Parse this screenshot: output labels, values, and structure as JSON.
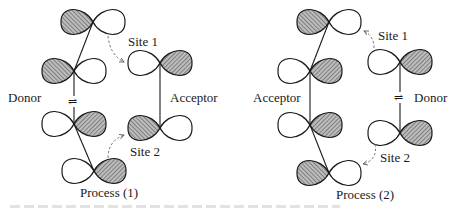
{
  "colors": {
    "stroke": "#1a1a1a",
    "hatch": "#555555",
    "hatch_bg": "#bdbdbd",
    "arrow": "#666666"
  },
  "panels": [
    {
      "id": "process-1",
      "caption": "Process (1)",
      "caption_pos": [
        92,
        186
      ],
      "labels": [
        {
          "text": "Donor",
          "x": 8,
          "y": 91,
          "role": "donor"
        },
        {
          "text": "Acceptor",
          "x": 170,
          "y": 91,
          "role": "acceptor"
        },
        {
          "text": "Site 1",
          "x": 128,
          "y": 35,
          "role": "site-1"
        },
        {
          "text": "Site 2",
          "x": 130,
          "y": 145,
          "role": "site-2"
        }
      ],
      "equilibrium_symbol": {
        "glyph": "⇌",
        "x": 74,
        "y": 97
      },
      "bonds": [
        [
          [
            93,
            22
          ],
          [
            74,
            71
          ]
        ],
        [
          [
            74,
            71
          ],
          [
            74,
            124
          ]
        ],
        [
          [
            74,
            124
          ],
          [
            94,
            171
          ]
        ],
        [
          [
            160,
            63
          ],
          [
            160,
            128
          ]
        ]
      ],
      "orbitals": [
        {
          "group": "donor",
          "cx": 93,
          "cy": 22,
          "len": 32,
          "shaded": "left"
        },
        {
          "group": "donor",
          "cx": 74,
          "cy": 71,
          "len": 32,
          "shaded": "left"
        },
        {
          "group": "donor",
          "cx": 74,
          "cy": 124,
          "len": 32,
          "shaded": "right"
        },
        {
          "group": "donor",
          "cx": 94,
          "cy": 171,
          "len": 32,
          "shaded": "right"
        },
        {
          "group": "acceptor",
          "cx": 160,
          "cy": 63,
          "len": 32,
          "shaded": "right"
        },
        {
          "group": "acceptor",
          "cx": 160,
          "cy": 128,
          "len": 32,
          "shaded": "left"
        }
      ],
      "arrows": [
        {
          "site": "site-1",
          "path": "M 108 36 Q 110 55 124 62"
        },
        {
          "site": "site-2",
          "path": "M 108 158 Q 108 141 124 135"
        }
      ]
    },
    {
      "id": "process-2",
      "caption": "Process (2)",
      "caption_pos": [
        338,
        188
      ],
      "labels": [
        {
          "text": "Acceptor",
          "x": 253,
          "y": 91,
          "role": "acceptor"
        },
        {
          "text": "Donor",
          "x": 414,
          "y": 91,
          "role": "donor"
        },
        {
          "text": "Site 1",
          "x": 378,
          "y": 29,
          "role": "site-1"
        },
        {
          "text": "Site 2",
          "x": 380,
          "y": 151,
          "role": "site-2"
        }
      ],
      "equilibrium_symbol": {
        "glyph": "⇌",
        "x": 400,
        "y": 97
      },
      "bonds": [
        [
          [
            329,
            22
          ],
          [
            310,
            71
          ]
        ],
        [
          [
            310,
            71
          ],
          [
            310,
            125
          ]
        ],
        [
          [
            310,
            125
          ],
          [
            329,
            173
          ]
        ],
        [
          [
            400,
            62
          ],
          [
            400,
            133
          ]
        ]
      ],
      "orbitals": [
        {
          "group": "acceptor",
          "cx": 329,
          "cy": 22,
          "len": 32,
          "shaded": "left"
        },
        {
          "group": "acceptor",
          "cx": 310,
          "cy": 71,
          "len": 32,
          "shaded": "right"
        },
        {
          "group": "acceptor",
          "cx": 310,
          "cy": 125,
          "len": 32,
          "shaded": "right"
        },
        {
          "group": "acceptor",
          "cx": 329,
          "cy": 173,
          "len": 32,
          "shaded": "left"
        },
        {
          "group": "donor",
          "cx": 400,
          "cy": 62,
          "len": 32,
          "shaded": "right"
        },
        {
          "group": "donor",
          "cx": 400,
          "cy": 133,
          "len": 32,
          "shaded": "right"
        }
      ],
      "arrows": [
        {
          "site": "site-1",
          "path": "M 374 48 Q 374 36 364 31"
        },
        {
          "site": "site-2",
          "path": "M 375 144 Q 378 160 363 164"
        }
      ]
    }
  ]
}
